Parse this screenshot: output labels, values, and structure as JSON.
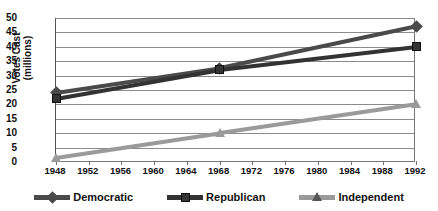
{
  "chart_data": {
    "type": "line",
    "title": "",
    "xlabel": "",
    "ylabel": "Votes Cast (millions)",
    "ylabel_line1": "Votes Cast",
    "ylabel_line2": "(millions)",
    "x": [
      1948,
      1952,
      1956,
      1960,
      1964,
      1968,
      1972,
      1976,
      1980,
      1984,
      1988,
      1992
    ],
    "xticklabels": [
      "1948",
      "1952",
      "1956",
      "1960",
      "1964",
      "1968",
      "1972",
      "1976",
      "1980",
      "1984",
      "1988",
      "1992"
    ],
    "yticklabels": [
      "50",
      "45",
      "40",
      "35",
      "30",
      "25",
      "20",
      "15",
      "10",
      "5",
      "0"
    ],
    "yticks": [
      50,
      45,
      40,
      35,
      30,
      25,
      20,
      15,
      10,
      5,
      0
    ],
    "ylim": [
      0,
      50
    ],
    "xlim": [
      1948,
      1992
    ],
    "grid": true,
    "legend_position": "bottom",
    "series": [
      {
        "name": "Democratic",
        "marker": "diamond",
        "color": "#4a4a4a",
        "endpoints_x": [
          1948,
          1968,
          1992
        ],
        "endpoints_y": [
          24,
          32.5,
          47
        ],
        "values": [
          24,
          27,
          29,
          31,
          32,
          32.5,
          35,
          37,
          39,
          42,
          44.5,
          47
        ]
      },
      {
        "name": "Republican",
        "marker": "square",
        "color": "#333333",
        "endpoints_x": [
          1948,
          1968,
          1992
        ],
        "endpoints_y": [
          22,
          32,
          40
        ],
        "values": [
          22,
          24,
          26,
          28,
          30,
          32,
          33.5,
          35,
          36.5,
          37.5,
          38.5,
          40
        ]
      },
      {
        "name": "Independent",
        "marker": "triangle",
        "color": "#9a9a9a",
        "endpoints_x": [
          1948,
          1968,
          1992
        ],
        "endpoints_y": [
          1.5,
          10,
          20
        ],
        "values": [
          1.5,
          3,
          4.5,
          6,
          8,
          10,
          12,
          13.5,
          15,
          16.5,
          18,
          20
        ]
      }
    ]
  }
}
